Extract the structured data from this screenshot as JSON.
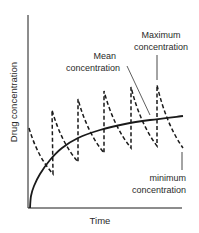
{
  "chart_data": {
    "type": "line",
    "title": "",
    "xlabel": "Time",
    "ylabel": "Drug concentration",
    "grid": false,
    "legend": "none",
    "series": [
      {
        "name": "Drug concentration (repeated dosing)",
        "style": "dashed",
        "points_px": [
          [
            29,
            128
          ],
          [
            53,
            174
          ],
          [
            52,
            110
          ],
          [
            78,
            162
          ],
          [
            78,
            99
          ],
          [
            104,
            153
          ],
          [
            104,
            91
          ],
          [
            131,
            148
          ],
          [
            131,
            87
          ],
          [
            157,
            146
          ],
          [
            157,
            85
          ],
          [
            183,
            148
          ]
        ]
      },
      {
        "name": "Mean concentration",
        "style": "solid",
        "points_px": [
          [
            30,
            208
          ],
          [
            31,
            196
          ],
          [
            34,
            186
          ],
          [
            40,
            174
          ],
          [
            50,
            160
          ],
          [
            62,
            148
          ],
          [
            78,
            138
          ],
          [
            100,
            130
          ],
          [
            125,
            124
          ],
          [
            150,
            120
          ],
          [
            183,
            116
          ]
        ]
      }
    ],
    "annotations": [
      {
        "label_lines": [
          "Maximum",
          "concentration"
        ],
        "x": 161,
        "y": 34
      },
      {
        "label_lines": [
          "Mean",
          "concentration"
        ],
        "x": 120,
        "y": 56
      },
      {
        "label_lines": [
          "minimum",
          "concentration"
        ],
        "x": 186,
        "y": 176
      }
    ]
  },
  "labels": {
    "xlabel": "Time",
    "ylabel": "Drug concentration",
    "max_line1": "Maximum",
    "max_line2": "concentration",
    "mean_line1": "Mean",
    "mean_line2": "concentration",
    "min_line1": "minimum",
    "min_line2": "concentration"
  },
  "colors": {
    "ink": "#1a1a1a",
    "text": "#2a2a2a",
    "background": "#ffffff"
  }
}
